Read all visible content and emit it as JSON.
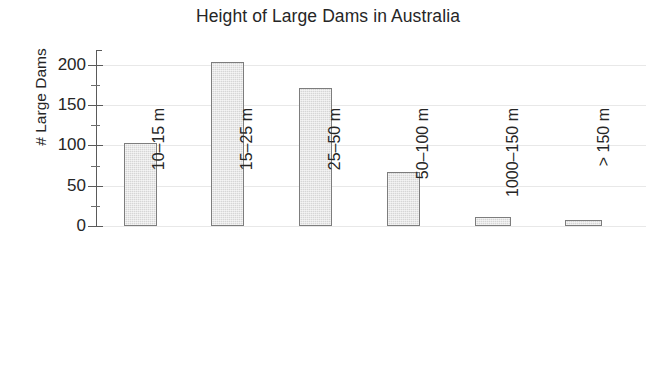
{
  "chart_data": {
    "type": "bar",
    "title": "Height of Large Dams in Australia",
    "xlabel": "",
    "ylabel": "# Large Dams",
    "categories": [
      "10–15 m",
      "15–25 m",
      "25–50 m",
      "50–100 m",
      "1000–150 m",
      "> 150 m"
    ],
    "values": [
      103,
      204,
      171,
      67,
      11,
      7
    ],
    "ylim": [
      0,
      210
    ],
    "yticks": [
      0,
      50,
      100,
      150,
      200
    ],
    "ytick_labels": [
      "0",
      "50",
      "100",
      "150",
      "200"
    ],
    "yminor_ticks": [
      25,
      75,
      125,
      175
    ],
    "grid": "horizontal",
    "legend": "none",
    "bar_fill": "#d6d6d6",
    "bar_border": "#7d7d7d",
    "gridline_color": "#e8e8e8",
    "axis_color": "#5a5a5a",
    "text_color": "#262626",
    "background": "#ffffff"
  }
}
